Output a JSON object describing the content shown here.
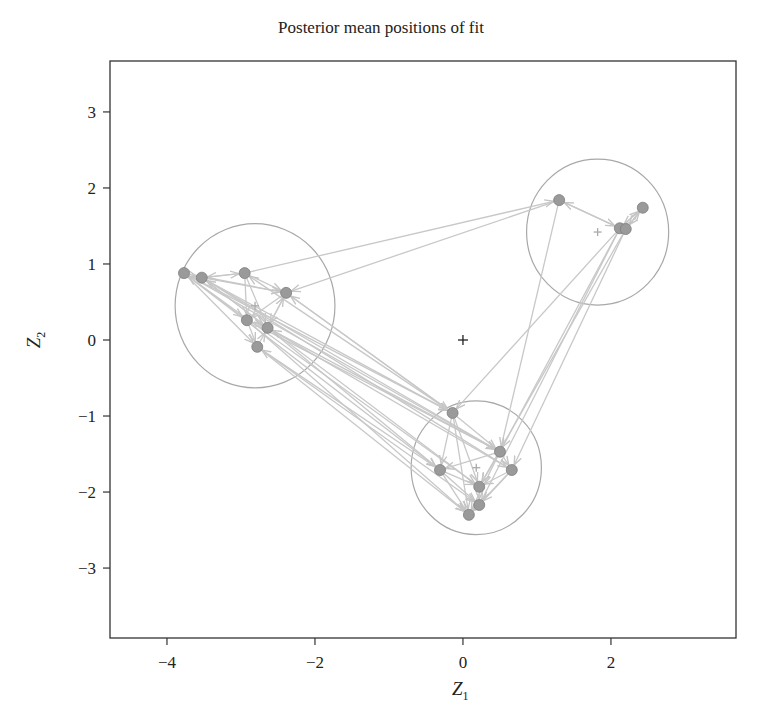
{
  "chart_data": {
    "type": "scatter",
    "title": "Posterior mean positions of fit",
    "xlabel": "Z",
    "xlabel_sub": "1",
    "ylabel": "Z",
    "ylabel_sub": "2",
    "xlim": [
      -4.77,
      3.69
    ],
    "ylim": [
      -3.92,
      3.67
    ],
    "xticks": [
      -4,
      -2,
      0,
      2
    ],
    "xtick_labels": [
      "−4",
      "−2",
      "0",
      "2"
    ],
    "yticks": [
      -3,
      -2,
      -1,
      0,
      1,
      2,
      3
    ],
    "ytick_labels": [
      "−3",
      "−2",
      "−1",
      "0",
      "1",
      "2",
      "3"
    ],
    "grid": false,
    "legend": null,
    "colors": {
      "node": "#9a9a9a",
      "node_stroke": "#7d7d7d",
      "edge": "#c8c8c8",
      "circle": "#a8a8a8",
      "axis": "#333333",
      "origin_marker": "#222222",
      "center_marker": "#aaaaaa"
    },
    "origin_marker": {
      "x": 0,
      "y": 0,
      "symbol": "+"
    },
    "clusters": [
      {
        "name": "cluster-left",
        "center": [
          -2.81,
          0.45
        ],
        "radius": 1.08
      },
      {
        "name": "cluster-right",
        "center": [
          1.82,
          1.42
        ],
        "radius": 0.96
      },
      {
        "name": "cluster-bottom",
        "center": [
          0.18,
          -1.68
        ],
        "radius": 0.88
      }
    ],
    "nodes": [
      {
        "id": 0,
        "x": -3.77,
        "y": 0.88,
        "cluster": 0
      },
      {
        "id": 1,
        "x": -3.53,
        "y": 0.82,
        "cluster": 0
      },
      {
        "id": 2,
        "x": -2.95,
        "y": 0.88,
        "cluster": 0
      },
      {
        "id": 3,
        "x": -2.39,
        "y": 0.62,
        "cluster": 0
      },
      {
        "id": 4,
        "x": -2.92,
        "y": 0.26,
        "cluster": 0
      },
      {
        "id": 5,
        "x": -2.64,
        "y": 0.16,
        "cluster": 0
      },
      {
        "id": 6,
        "x": -2.78,
        "y": -0.09,
        "cluster": 0
      },
      {
        "id": 7,
        "x": 1.3,
        "y": 1.84,
        "cluster": 1
      },
      {
        "id": 8,
        "x": 2.43,
        "y": 1.74,
        "cluster": 1
      },
      {
        "id": 9,
        "x": 2.12,
        "y": 1.47,
        "cluster": 1
      },
      {
        "id": 10,
        "x": 2.2,
        "y": 1.46,
        "cluster": 1
      },
      {
        "id": 11,
        "x": -0.14,
        "y": -0.96,
        "cluster": 2
      },
      {
        "id": 12,
        "x": 0.5,
        "y": -1.47,
        "cluster": 2
      },
      {
        "id": 13,
        "x": -0.31,
        "y": -1.71,
        "cluster": 2
      },
      {
        "id": 14,
        "x": 0.66,
        "y": -1.71,
        "cluster": 2
      },
      {
        "id": 15,
        "x": 0.22,
        "y": -1.93,
        "cluster": 2
      },
      {
        "id": 16,
        "x": 0.22,
        "y": -2.17,
        "cluster": 2
      },
      {
        "id": 17,
        "x": 0.08,
        "y": -2.3,
        "cluster": 2
      }
    ],
    "edges": [
      [
        0,
        1
      ],
      [
        1,
        2
      ],
      [
        2,
        1
      ],
      [
        0,
        3
      ],
      [
        1,
        3
      ],
      [
        2,
        3
      ],
      [
        2,
        4
      ],
      [
        3,
        4
      ],
      [
        4,
        5
      ],
      [
        5,
        3
      ],
      [
        1,
        5
      ],
      [
        0,
        6
      ],
      [
        4,
        6
      ],
      [
        3,
        5
      ],
      [
        2,
        5
      ],
      [
        6,
        5
      ],
      [
        0,
        4
      ],
      [
        2,
        7
      ],
      [
        7,
        3
      ],
      [
        7,
        9
      ],
      [
        9,
        7
      ],
      [
        8,
        9
      ],
      [
        9,
        8
      ],
      [
        10,
        8
      ],
      [
        8,
        10
      ],
      [
        7,
        12
      ],
      [
        9,
        12
      ],
      [
        10,
        14
      ],
      [
        9,
        11
      ],
      [
        10,
        15
      ],
      [
        9,
        16
      ],
      [
        0,
        11
      ],
      [
        1,
        11
      ],
      [
        3,
        11
      ],
      [
        0,
        12
      ],
      [
        1,
        12
      ],
      [
        4,
        12
      ],
      [
        5,
        14
      ],
      [
        0,
        13
      ],
      [
        1,
        15
      ],
      [
        6,
        16
      ],
      [
        4,
        17
      ],
      [
        6,
        17
      ],
      [
        5,
        13
      ],
      [
        11,
        3
      ],
      [
        12,
        5
      ],
      [
        13,
        6
      ],
      [
        14,
        1
      ],
      [
        15,
        0
      ],
      [
        11,
        2
      ],
      [
        11,
        12
      ],
      [
        11,
        13
      ],
      [
        11,
        15
      ],
      [
        11,
        17
      ],
      [
        12,
        13
      ],
      [
        12,
        14
      ],
      [
        12,
        15
      ],
      [
        13,
        15
      ],
      [
        13,
        17
      ],
      [
        14,
        15
      ],
      [
        14,
        16
      ],
      [
        15,
        16
      ],
      [
        16,
        17
      ],
      [
        12,
        17
      ],
      [
        14,
        17
      ],
      [
        13,
        16
      ]
    ]
  }
}
